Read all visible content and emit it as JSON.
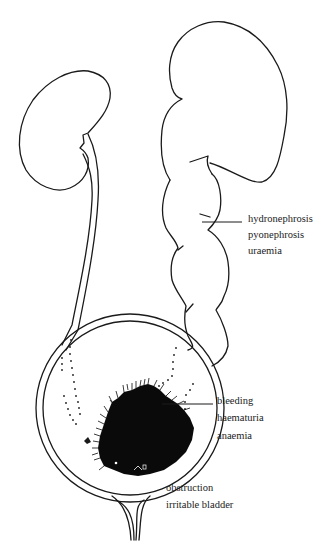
{
  "diagram": {
    "title": "",
    "labels": {
      "kidney_group": [
        "hydronephrosis",
        "pyonephrosis",
        "uraemia"
      ],
      "tumour_group": [
        "bleeding",
        "haematuria",
        "anaemia"
      ],
      "outlet_group": [
        "obstruction",
        "irritable bladder"
      ]
    },
    "structures": [
      "left-kidney",
      "left-ureter",
      "right-kidney-hydronephrotic",
      "dilated-right-ureter",
      "bladder",
      "bladder-tumour",
      "urethra"
    ],
    "colors": {
      "line": "#1a1a1a",
      "tumour": "#0a0a0a",
      "background": "#ffffff",
      "text": "#222222"
    }
  }
}
